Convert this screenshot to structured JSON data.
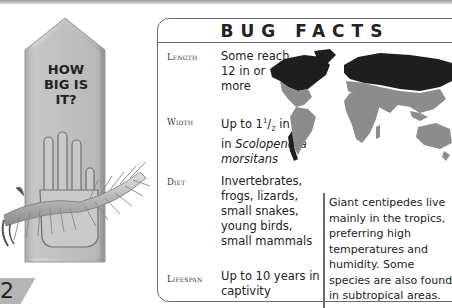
{
  "ruler": {
    "title_lines": [
      "HOW",
      "BIG IS",
      "IT?"
    ],
    "image": "centipede-on-hand-illustration"
  },
  "page_number": "2",
  "facts": {
    "title": "BUG FACTS",
    "items": [
      {
        "label": "Length",
        "value_lines": [
          "Some reach",
          "12 in or",
          "more"
        ]
      },
      {
        "label": "Width",
        "value_html_parts": {
          "prefix": "Up to 1",
          "sup": "1",
          "slash": "/",
          "sub": "2",
          "suffix": " in",
          "line2_prefix": "in ",
          "species_1": "Scolopendra",
          "species_2": "morsitans"
        }
      },
      {
        "label": "Diet",
        "value_lines": [
          "Invertebrates,",
          "frogs, lizards,",
          "small snakes,",
          "young birds,",
          "small mammals"
        ]
      },
      {
        "label": "Lifespan",
        "value_lines": [
          "Up to 10 years in",
          "captivity"
        ]
      }
    ]
  },
  "map": {
    "image": "world-distribution-map",
    "colors": {
      "habitat": "#8c8c8c",
      "non_habitat": "#1e1e1e"
    }
  },
  "habitat_text": "Giant centipedes live mainly in the tropics, preferring high temperatures and humidity. Some species are also found in subtropical areas."
}
